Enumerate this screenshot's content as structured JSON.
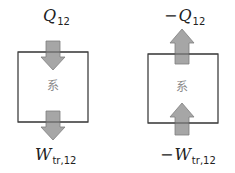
{
  "diagram": {
    "colors": {
      "box_stroke": "#404040",
      "arrow_fill": "#a6a6a6",
      "arrow_stroke": "#7f7f7f",
      "system_label": "#8a8a8a"
    },
    "panels": [
      {
        "id": "left",
        "system_label": "系",
        "top_arrow": {
          "direction": "down",
          "label": {
            "sign": "",
            "symbol": "Q",
            "subscript": "12"
          }
        },
        "bottom_arrow": {
          "direction": "down",
          "label": {
            "sign": "",
            "symbol": "W",
            "subscript": "tr,12"
          }
        }
      },
      {
        "id": "right",
        "system_label": "系",
        "top_arrow": {
          "direction": "up",
          "label": {
            "sign": "−",
            "symbol": "Q",
            "subscript": "12"
          }
        },
        "bottom_arrow": {
          "direction": "up",
          "label": {
            "sign": "−",
            "symbol": "W",
            "subscript": "tr,12"
          }
        }
      }
    ]
  }
}
